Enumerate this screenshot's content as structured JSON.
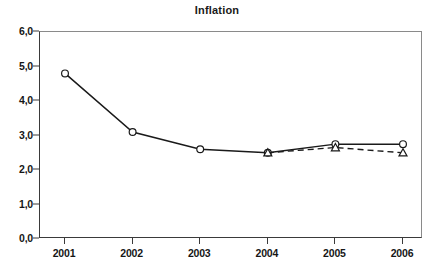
{
  "chart_data": {
    "type": "line",
    "title": "Inflation",
    "xlabel": "",
    "ylabel": "",
    "categories": [
      "2001",
      "2002",
      "2003",
      "2004",
      "2005",
      "2006"
    ],
    "x_tick_labels": [
      "2001",
      "2002",
      "2003",
      "2004",
      "2005",
      "2006"
    ],
    "y_tick_labels": [
      "0,0",
      "1,0",
      "2,0",
      "3,0",
      "4,0",
      "5,0",
      "6,0"
    ],
    "y_tick_values": [
      0,
      1,
      2,
      3,
      4,
      5,
      6
    ],
    "ylim": [
      0,
      6
    ],
    "xlim": [
      2001,
      2006
    ],
    "grid": false,
    "legend": false,
    "legend_position": "none",
    "decimal_separator": ",",
    "series": [
      {
        "name": "series-solid-circle",
        "line_style": "solid",
        "marker": "circle",
        "color": "#1a1a1a",
        "x": [
          "2001",
          "2002",
          "2003",
          "2004",
          "2005",
          "2006"
        ],
        "values": [
          4.8,
          3.1,
          2.6,
          2.5,
          2.75,
          2.75
        ]
      },
      {
        "name": "series-dashed-triangle",
        "line_style": "dashed",
        "marker": "triangle",
        "color": "#1a1a1a",
        "x": [
          "2004",
          "2005",
          "2006"
        ],
        "values": [
          2.5,
          2.65,
          2.5
        ]
      }
    ],
    "colors": {
      "background": "#ffffff",
      "axis": "#3a3a3a",
      "frame": "#8a8a8a",
      "text": "#161616",
      "series": "#1a1a1a"
    }
  }
}
